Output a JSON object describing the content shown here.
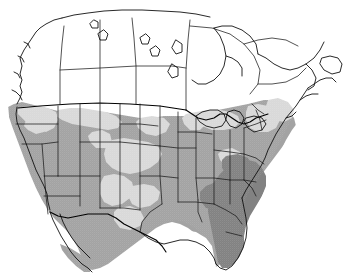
{
  "map": {
    "title": "North America Distribution Map",
    "region": "North America",
    "projection_note": "conic",
    "background_color": "#ffffff",
    "width": 358,
    "height": 278,
    "legend_visible": false,
    "labels_visible": false,
    "classes": [
      {
        "key": "none",
        "label": "Absent",
        "color": "#ffffff"
      },
      {
        "key": "low",
        "label": "Low density",
        "color": "#d9d9d9"
      },
      {
        "key": "med",
        "label": "Medium density",
        "color": "#a3a3a3"
      },
      {
        "key": "high",
        "label": "High density",
        "color": "#828282"
      }
    ],
    "line_colors": {
      "state_border": "#1a1a1a",
      "coastline": "#111111",
      "international_border": "#000000"
    },
    "areas": {
      "canada": "none",
      "conterminous_us": "med",
      "rocky_mountain_gaps": "low",
      "great_plains_gap": "low",
      "great_lakes_shore": "low",
      "new_england": "low",
      "northern_mexico": "med",
      "southeast_coastal_plain": "high",
      "florida": "high",
      "baja_california": "med"
    }
  }
}
